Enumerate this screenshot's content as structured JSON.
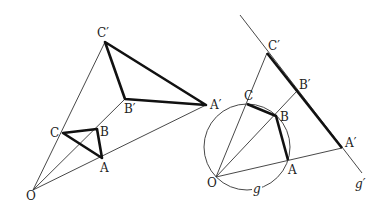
{
  "figures": [
    {
      "name": "central-dilation",
      "labels": {
        "O": "O",
        "A": "A",
        "B": "B",
        "C": "C",
        "A_prime": "A′",
        "B_prime": "B′",
        "C_prime": "C′"
      }
    },
    {
      "name": "inversion-circle",
      "labels": {
        "O": "O",
        "A": "A",
        "B": "B",
        "C": "C",
        "A_prime": "A′",
        "B_prime": "B′",
        "C_prime": "C′",
        "circle": "g",
        "line": "g′"
      }
    }
  ]
}
